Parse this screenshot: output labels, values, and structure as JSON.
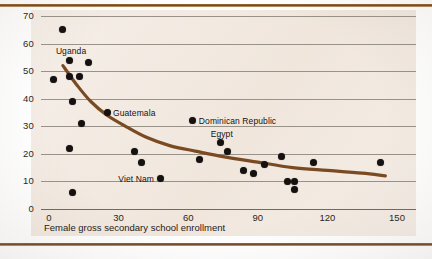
{
  "chart_data": {
    "type": "scatter",
    "title": "",
    "subtitle": "",
    "xlabel": "Female gross secondary school enrollment",
    "ylabel": "",
    "xlim": [
      0,
      150
    ],
    "ylim": [
      0,
      70
    ],
    "xticks": [
      0,
      30,
      60,
      90,
      120,
      150
    ],
    "yticks": [
      0,
      10,
      20,
      30,
      40,
      50,
      60,
      70
    ],
    "grid": "horizontal",
    "legend": "none",
    "series": [
      {
        "name": "countries",
        "marker": "filled-circle",
        "color": "#141110",
        "points": [
          {
            "x": 6,
            "y": 65,
            "label": ""
          },
          {
            "x": 9,
            "y": 54,
            "label": "Uganda"
          },
          {
            "x": 17,
            "y": 53,
            "label": ""
          },
          {
            "x": 2,
            "y": 47,
            "label": ""
          },
          {
            "x": 9,
            "y": 48,
            "label": ""
          },
          {
            "x": 13,
            "y": 48,
            "label": ""
          },
          {
            "x": 10,
            "y": 39,
            "label": ""
          },
          {
            "x": 14,
            "y": 31,
            "label": ""
          },
          {
            "x": 9,
            "y": 22,
            "label": ""
          },
          {
            "x": 10,
            "y": 6,
            "label": ""
          },
          {
            "x": 25,
            "y": 35,
            "label": "Guatemala"
          },
          {
            "x": 37,
            "y": 21,
            "label": ""
          },
          {
            "x": 40,
            "y": 17,
            "label": ""
          },
          {
            "x": 48,
            "y": 11,
            "label": "Viet Nam"
          },
          {
            "x": 62,
            "y": 32,
            "label": "Dominican Republic"
          },
          {
            "x": 65,
            "y": 18,
            "label": ""
          },
          {
            "x": 74,
            "y": 24,
            "label": "Egypt"
          },
          {
            "x": 77,
            "y": 21,
            "label": ""
          },
          {
            "x": 84,
            "y": 14,
            "label": ""
          },
          {
            "x": 88,
            "y": 13,
            "label": ""
          },
          {
            "x": 93,
            "y": 16,
            "label": ""
          },
          {
            "x": 100,
            "y": 19,
            "label": ""
          },
          {
            "x": 103,
            "y": 10,
            "label": ""
          },
          {
            "x": 106,
            "y": 10,
            "label": ""
          },
          {
            "x": 106,
            "y": 7,
            "label": ""
          },
          {
            "x": 114,
            "y": 17,
            "label": ""
          },
          {
            "x": 143,
            "y": 17,
            "label": ""
          }
        ]
      }
    ],
    "trendline": {
      "name": "fitted-curve",
      "color": "#7a4a22",
      "points": [
        {
          "x": 6,
          "y": 52
        },
        {
          "x": 12,
          "y": 45
        },
        {
          "x": 18,
          "y": 39
        },
        {
          "x": 25,
          "y": 34
        },
        {
          "x": 33,
          "y": 30
        },
        {
          "x": 42,
          "y": 26
        },
        {
          "x": 52,
          "y": 23
        },
        {
          "x": 63,
          "y": 21
        },
        {
          "x": 75,
          "y": 19
        },
        {
          "x": 90,
          "y": 17
        },
        {
          "x": 105,
          "y": 15
        },
        {
          "x": 120,
          "y": 14
        },
        {
          "x": 135,
          "y": 13
        },
        {
          "x": 145,
          "y": 12
        }
      ]
    },
    "point_labels": [
      {
        "text": "Uganda",
        "x": 9,
        "y": 54,
        "anchor": "above"
      },
      {
        "text": "Guatemala",
        "x": 25,
        "y": 35,
        "anchor": "right"
      },
      {
        "text": "Dominican Republic",
        "x": 62,
        "y": 32,
        "anchor": "right"
      },
      {
        "text": "Egypt",
        "x": 74,
        "y": 24,
        "anchor": "above"
      },
      {
        "text": "Viet Nam",
        "x": 48,
        "y": 11,
        "anchor": "left"
      }
    ],
    "colors": {
      "plot_background": "#f2e9e0",
      "page_background": "#ffffff",
      "marker": "#141110",
      "trend": "#7a4a22",
      "grid": "#8a8279",
      "rule": "#6d4420"
    }
  },
  "axis": {
    "x_title": "Female gross secondary school enrollment",
    "x_tick_labels": [
      "0",
      "30",
      "60",
      "90",
      "120",
      "150"
    ],
    "y_tick_labels": [
      "0",
      "10",
      "20",
      "30",
      "40",
      "50",
      "60",
      "70"
    ]
  }
}
